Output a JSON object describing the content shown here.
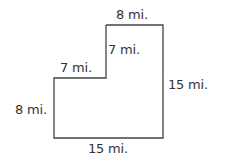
{
  "figure": {
    "stroke_color": "#444444",
    "units": "mi.",
    "labels": {
      "top": "8 mi.",
      "inner_vertical": "7 mi.",
      "inner_horizontal": "7 mi.",
      "right": "15 mi.",
      "left": "8 mi.",
      "bottom": "15 mi."
    }
  }
}
